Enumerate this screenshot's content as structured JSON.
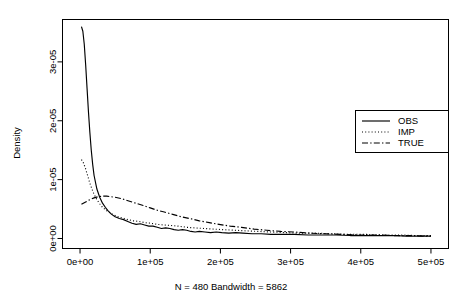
{
  "chart_data": {
    "type": "line",
    "title": "",
    "subtitle": "N = 480   Bandwidth = 5862",
    "xlabel": "",
    "ylabel": "Density",
    "xlim": [
      -25000,
      525000
    ],
    "ylim": [
      -1.7e-06,
      3.72e-05
    ],
    "grid": false,
    "legend_position": "right",
    "xticks": [
      0,
      100000,
      200000,
      300000,
      400000,
      500000
    ],
    "xtick_labels": [
      "0e+00",
      "1e+05",
      "2e+05",
      "3e+05",
      "4e+05",
      "5e+05"
    ],
    "yticks": [
      0,
      1e-05,
      2e-05,
      3e-05
    ],
    "ytick_labels": [
      "0e+00",
      "1e-05",
      "2e-05",
      "3e-05"
    ],
    "series": [
      {
        "name": "OBS",
        "linestyle": "solid",
        "x": [
          2000,
          4000,
          6000,
          8000,
          10000,
          12000,
          14000,
          16000,
          18000,
          20000,
          24000,
          28000,
          32000,
          36000,
          40000,
          45000,
          50000,
          56000,
          62000,
          68000,
          74000,
          80000,
          86000,
          92000,
          98000,
          104000,
          110000,
          116000,
          122000,
          128000,
          134000,
          140000,
          146000,
          152000,
          158000,
          164000,
          170000,
          178000,
          186000,
          194000,
          202000,
          212000,
          222000,
          232000,
          245000,
          258000,
          272000,
          288000,
          305000,
          325000,
          345000,
          365000,
          385000,
          405000,
          425000,
          445000,
          465000,
          485000,
          500000
        ],
        "y": [
          3.6e-05,
          3.52e-05,
          3.3e-05,
          2.95e-05,
          2.55e-05,
          2.15e-05,
          1.8e-05,
          1.5e-05,
          1.26e-05,
          1.07e-05,
          8.4e-06,
          7e-06,
          6e-06,
          5.3e-06,
          4.7e-06,
          4.1e-06,
          3.7e-06,
          3.4e-06,
          3.2e-06,
          2.9e-06,
          2.6e-06,
          2.4e-06,
          2.5e-06,
          2.3e-06,
          2.1e-06,
          2.1e-06,
          1.9e-06,
          1.7e-06,
          1.8e-06,
          1.7e-06,
          1.5e-06,
          1.4e-06,
          1.5e-06,
          1.4e-06,
          1.2e-06,
          1.1e-06,
          1.2e-06,
          1.1e-06,
          1e-06,
          1.1e-06,
          1e-06,
          9e-07,
          1e-06,
          9e-07,
          8e-07,
          8e-07,
          7e-07,
          7e-07,
          7e-07,
          6e-07,
          6e-07,
          6e-07,
          5e-07,
          5e-07,
          5e-07,
          5e-07,
          4e-07,
          4e-07,
          4e-07
        ]
      },
      {
        "name": "IMP",
        "linestyle": "dotted",
        "x": [
          2000,
          5000,
          8000,
          11000,
          14000,
          17000,
          20000,
          24000,
          28000,
          32000,
          37000,
          42000,
          48000,
          54000,
          60000,
          68000,
          76000,
          84000,
          92000,
          100000,
          110000,
          120000,
          130000,
          140000,
          152000,
          164000,
          176000,
          190000,
          204000,
          220000,
          236000,
          254000,
          272000,
          292000,
          312000,
          335000,
          358000,
          382000,
          406000,
          430000,
          455000,
          480000,
          500000
        ],
        "y": [
          1.34e-05,
          1.28e-05,
          1.18e-05,
          1.06e-05,
          9.4e-06,
          8.4e-06,
          7.5e-06,
          6.6e-06,
          5.9e-06,
          5.3e-06,
          4.8e-06,
          4.4e-06,
          4e-06,
          3.7e-06,
          3.5e-06,
          3.2e-06,
          3e-06,
          2.9e-06,
          2.7e-06,
          2.6e-06,
          2.4e-06,
          2.3e-06,
          2.2e-06,
          2.1e-06,
          1.9e-06,
          1.8e-06,
          1.7e-06,
          1.6e-06,
          1.5e-06,
          1.4e-06,
          1.3e-06,
          1.2e-06,
          1.1e-06,
          1e-06,
          9e-07,
          9e-07,
          8e-07,
          7e-07,
          7e-07,
          6e-07,
          6e-07,
          5e-07,
          5e-07
        ]
      },
      {
        "name": "TRUE",
        "linestyle": "dashdot",
        "x": [
          2000,
          8000,
          14000,
          20000,
          26000,
          32000,
          38000,
          44000,
          50000,
          58000,
          66000,
          74000,
          82000,
          90000,
          100000,
          110000,
          120000,
          132000,
          144000,
          156000,
          170000,
          184000,
          198000,
          214000,
          230000,
          248000,
          266000,
          286000,
          306000,
          328000,
          350000,
          374000,
          398000,
          422000,
          446000,
          470000,
          492000,
          500000
        ],
        "y": [
          5.8e-06,
          6.2e-06,
          6.6e-06,
          6.9e-06,
          7.1e-06,
          7.2e-06,
          7.2e-06,
          7.1e-06,
          7e-06,
          6.8e-06,
          6.5e-06,
          6.2e-06,
          5.9e-06,
          5.6e-06,
          5.2e-06,
          4.8e-06,
          4.5e-06,
          4.1e-06,
          3.7e-06,
          3.4e-06,
          3e-06,
          2.7e-06,
          2.4e-06,
          2.1e-06,
          1.9e-06,
          1.6e-06,
          1.4e-06,
          1.2e-06,
          1.1e-06,
          9e-07,
          8e-07,
          7e-07,
          6e-07,
          6e-07,
          5e-07,
          5e-07,
          4e-07,
          4e-07
        ]
      }
    ]
  },
  "legend": {
    "entries": [
      {
        "label": "OBS"
      },
      {
        "label": "IMP"
      },
      {
        "label": "TRUE"
      }
    ]
  }
}
